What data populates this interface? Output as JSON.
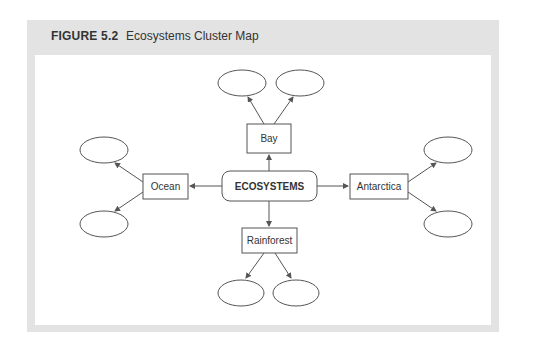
{
  "figure": {
    "label": "FIGURE 5.2",
    "title": "Ecosystems Cluster Map"
  },
  "diagram": {
    "center": "ECOSYSTEMS",
    "branches": {
      "top": "Bay",
      "left": "Ocean",
      "right": "Antarctica",
      "bottom": "Rainforest"
    },
    "leaf_ellipses_per_branch": 2,
    "colors": {
      "frame": "#e3e3e3",
      "stroke": "#555555",
      "text": "#333333"
    }
  }
}
